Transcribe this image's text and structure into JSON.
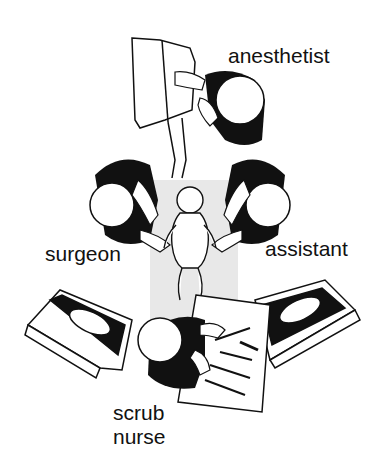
{
  "diagram": {
    "type": "operating-room-layout",
    "labels": {
      "anesthetist": "anesthetist",
      "surgeon": "surgeon",
      "assistant": "assistant",
      "scrub_nurse_line1": "scrub",
      "scrub_nurse_line2": "nurse"
    },
    "elements": [
      "anesthesia-machine",
      "anesthetist",
      "surgeon",
      "assistant",
      "infant-patient",
      "operating-table",
      "left-monitor",
      "right-monitor",
      "scrub-nurse",
      "instrument-tray"
    ],
    "colors": {
      "ink": "#111111",
      "table": "#e8e8e8",
      "background": "#ffffff"
    }
  }
}
